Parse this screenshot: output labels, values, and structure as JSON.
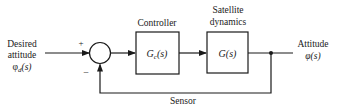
{
  "diagram": {
    "type": "feedback-control-block-diagram",
    "input": {
      "line1": "Desired",
      "line2": "attitude",
      "symbol": "φ",
      "subscript": "d",
      "arg": "(s)"
    },
    "summing_junction": {
      "plus_sign": "+",
      "minus_sign": "−"
    },
    "controller": {
      "title": "Controller",
      "symbol": "G",
      "subscript": "c",
      "arg": "(s)"
    },
    "plant": {
      "title_line1": "Satellite",
      "title_line2": "dynamics",
      "label": "G(s)"
    },
    "output": {
      "line1": "Attitude",
      "label": "φ(s)"
    },
    "feedback": {
      "label": "Sensor"
    },
    "colors": {
      "stroke": "#1a1a1a",
      "background": "#ffffff"
    }
  }
}
